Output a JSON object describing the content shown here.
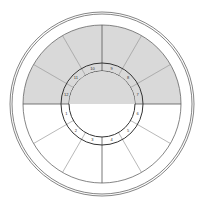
{
  "diagram": {
    "type": "astrological-chart-wheel",
    "houses": [
      {
        "number": "1",
        "shaded": false
      },
      {
        "number": "2",
        "shaded": false
      },
      {
        "number": "3",
        "shaded": false
      },
      {
        "number": "4",
        "shaded": false
      },
      {
        "number": "5",
        "shaded": false
      },
      {
        "number": "6",
        "shaded": false
      },
      {
        "number": "7",
        "shaded": true
      },
      {
        "number": "8",
        "shaded": true
      },
      {
        "number": "9",
        "shaded": true
      },
      {
        "number": "10",
        "shaded": true
      },
      {
        "number": "11",
        "shaded": true
      },
      {
        "number": "12",
        "shaded": true
      }
    ],
    "colors": {
      "shade": "#d9d9d9",
      "line": "#555555",
      "background": "#ffffff"
    }
  }
}
